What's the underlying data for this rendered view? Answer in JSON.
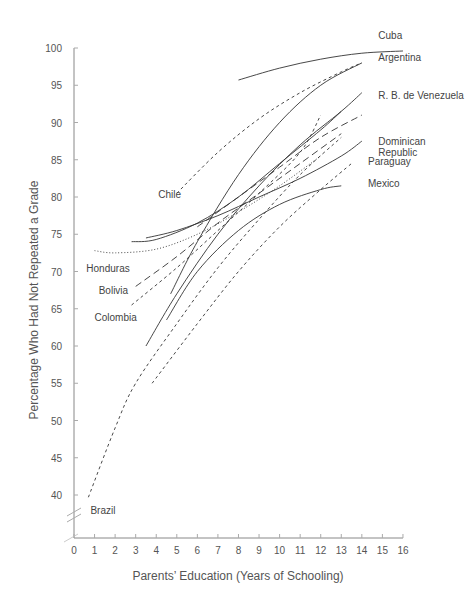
{
  "chart_data": {
    "type": "line",
    "title": "",
    "xlabel": "Parents’ Education (Years of Schooling)",
    "ylabel": "Percentage Who Had Not Repeated a Grade",
    "xlim": [
      0,
      16
    ],
    "ylim": [
      35,
      100
    ],
    "x_ticks": [
      "0",
      "1",
      "2",
      "3",
      "4",
      "5",
      "6",
      "7",
      "8",
      "9",
      "10",
      "11",
      "12",
      "13",
      "14",
      "15",
      "16"
    ],
    "y_ticks": [
      "40",
      "45",
      "50",
      "55",
      "60",
      "65",
      "70",
      "75",
      "80",
      "85",
      "90",
      "95",
      "100"
    ],
    "grid": false,
    "legend": "direct labels at line ends",
    "series": [
      {
        "name": "Cuba",
        "style": "solid",
        "x": [
          8,
          10,
          12,
          14,
          16
        ],
        "y": [
          95.7,
          97.3,
          98.5,
          99.3,
          99.6
        ],
        "label_pos": [
          14.8,
          101.2
        ]
      },
      {
        "name": "Argentina",
        "style": "solid",
        "x": [
          4.7,
          6,
          8,
          10,
          12,
          14
        ],
        "y": [
          67,
          74,
          83,
          90,
          95,
          98
        ],
        "label_pos": [
          14.8,
          98.3
        ]
      },
      {
        "name": "Chile",
        "style": "dashed",
        "x": [
          5,
          7,
          9,
          11,
          13,
          14
        ],
        "y": [
          80.5,
          86,
          90.5,
          94,
          96.8,
          98
        ],
        "label_pos": [
          4.1,
          79.8
        ]
      },
      {
        "name": "R. B. de Venezuela",
        "style": "solid",
        "x": [
          3.5,
          5,
          7,
          9,
          11,
          13,
          14
        ],
        "y": [
          60,
          67,
          75,
          81.5,
          87,
          91.5,
          94
        ],
        "label_pos": [
          14.8,
          93.2
        ]
      },
      {
        "name": "Dominican Republic",
        "style": "solid",
        "x": [
          3.5,
          5,
          7,
          9,
          11,
          13,
          14
        ],
        "y": [
          74.5,
          75.5,
          77.5,
          80,
          82.5,
          85.5,
          87.5
        ],
        "label_pos": [
          14.8,
          87
        ]
      },
      {
        "name": "Paraguay",
        "style": "dashed",
        "x": [
          3.8,
          6,
          8,
          10,
          12,
          13.5
        ],
        "y": [
          55,
          63,
          70,
          76,
          81,
          84.5
        ],
        "label_pos": [
          14.3,
          84.3
        ]
      },
      {
        "name": "Mexico",
        "style": "solid",
        "x": [
          4.5,
          6,
          8,
          10,
          12,
          13
        ],
        "y": [
          63.5,
          70,
          75.5,
          79,
          81,
          81.5
        ],
        "label_pos": [
          14.3,
          81.3
        ]
      },
      {
        "name": "Honduras",
        "style": "dotted",
        "x": [
          1,
          2,
          4,
          6,
          8,
          10,
          12
        ],
        "y": [
          72.8,
          72.5,
          73,
          75,
          78,
          81.5,
          85.5
        ],
        "label_pos": [
          0.6,
          70
        ]
      },
      {
        "name": "Bolivia",
        "style": "long-dash",
        "x": [
          3,
          5,
          7,
          9,
          11,
          13
        ],
        "y": [
          68,
          72,
          76.5,
          80.5,
          84.5,
          88.5
        ],
        "label_pos": [
          1.2,
          67
        ]
      },
      {
        "name": "Colombia",
        "style": "dashed",
        "x": [
          2.8,
          5,
          7,
          9,
          11,
          12
        ],
        "y": [
          65.5,
          70.5,
          75.5,
          80.5,
          86,
          91
        ],
        "label_pos": [
          1,
          63.3
        ]
      },
      {
        "name": "Brazil",
        "style": "dashed",
        "x": [
          0.7,
          2,
          3,
          5,
          7,
          9,
          11,
          13
        ],
        "y": [
          39.7,
          49,
          55,
          63,
          70.5,
          77,
          83,
          88
        ],
        "label_pos": [
          0.8,
          37.5
        ]
      },
      {
        "name": "Unlabeled solid (upper)",
        "style": "solid",
        "x": [
          2.8,
          4,
          6,
          8,
          10,
          12,
          13
        ],
        "y": [
          74,
          74.3,
          76.5,
          80,
          84.5,
          89,
          91.5
        ]
      },
      {
        "name": "Unlabeled long-dash (upper)",
        "style": "long-dash",
        "x": [
          6,
          8,
          10,
          12,
          14
        ],
        "y": [
          76,
          80,
          84,
          88,
          91
        ]
      }
    ]
  },
  "axes": {
    "x_title": "Parents’ Education (Years of Schooling)",
    "y_title": "Percentage Who Had Not Repeated a Grade"
  }
}
